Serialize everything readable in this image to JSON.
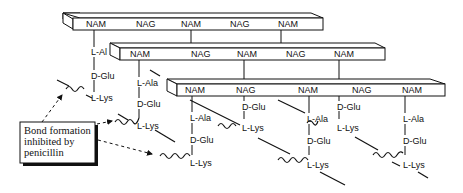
{
  "diagram": {
    "type": "peptidoglycan cross-linking",
    "strands": [
      {
        "id": "strand-1",
        "sugars": [
          "NAM",
          "NAG",
          "NAM",
          "NAG",
          "NAM"
        ]
      },
      {
        "id": "strand-2",
        "sugars": [
          "NAM",
          "NAG",
          "NAM",
          "NAG",
          "NAM"
        ]
      },
      {
        "id": "strand-3",
        "sugars": [
          "NAM",
          "NAG",
          "NAM",
          "NAG",
          "NAM"
        ]
      }
    ],
    "peptides": {
      "p1": [
        "L-Al",
        "D-Glu",
        "L-Lys"
      ],
      "p2": [
        "L-Ala",
        "D-Glu",
        "L-Lys"
      ],
      "p3": [
        "L-Ala",
        "D-Glu",
        "L-Lys"
      ],
      "p4": [
        "D-Glu",
        "L-Lys"
      ],
      "p5": [
        "L-Ala",
        "D-Glu",
        "L-Lys"
      ],
      "p6": [
        "D-Glu",
        "L-Lys"
      ],
      "p7": [
        "L-Ala",
        "D-Glu",
        "L-Lys"
      ]
    },
    "callout": {
      "line1": "Bond formation",
      "line2": "inhibited by",
      "line3": "penicillin"
    },
    "colors": {
      "ink": "#111111",
      "background": "#ffffff"
    }
  }
}
